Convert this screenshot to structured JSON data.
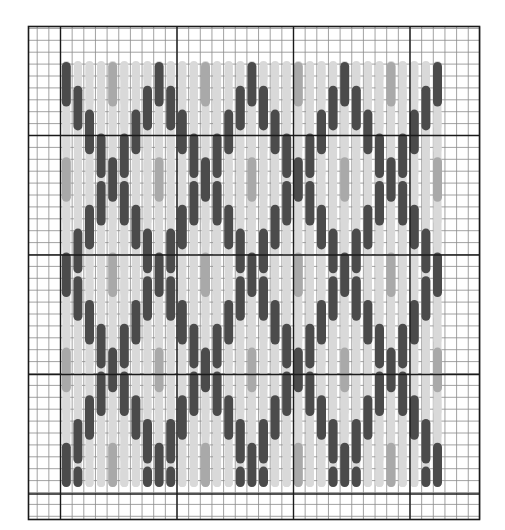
{
  "chart": {
    "type": "needlepoint-bargello-chart",
    "grid": {
      "left": 28.5,
      "top": 26.5,
      "right": 479.5,
      "bottom": 519.5,
      "cell_w": 11.65,
      "cell_h": 11.9,
      "major_x": [
        60.5,
        177,
        293.5,
        410
      ],
      "major_y": [
        135.5,
        255,
        374.5,
        494
      ],
      "minor_color": "#8a8a8a",
      "major_color": "#1a1a1a",
      "border_color": "#1a1a1a"
    },
    "stitches": {
      "columns": 33,
      "first_col_x": 66.3,
      "col_spacing": 11.6,
      "top_y": 61,
      "bottom_y": 487,
      "row_step_cells": 2,
      "stitch_len_cells": 4,
      "stitch_width": 8,
      "repeat_cells": 16,
      "zigzag_period_cols": 8
    },
    "colors": {
      "dark": "#4b4b4b",
      "medium": "#a9a9a9",
      "light": "#d9d9d9"
    },
    "legend": {
      "dark_label": "dark thread",
      "medium_label": "medium thread",
      "light_label": "light thread"
    }
  }
}
